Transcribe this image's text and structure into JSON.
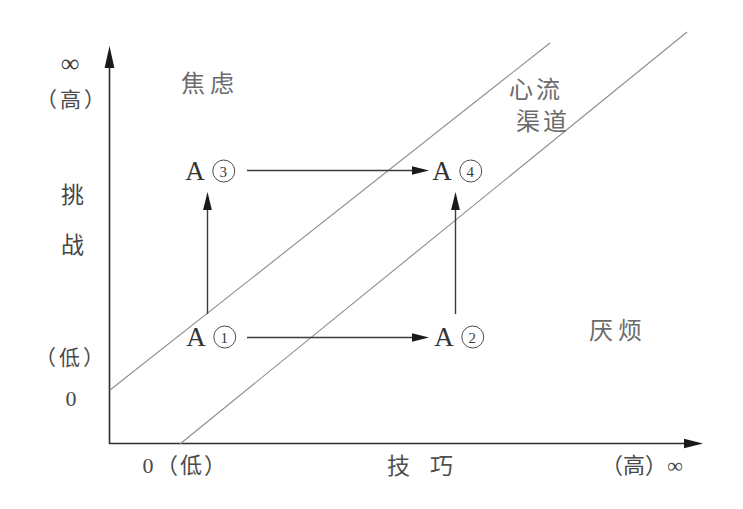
{
  "figure": {
    "type": "flow-channel-diagram",
    "colors": {
      "background": "#ffffff",
      "axis_ink": "#2e2e2e",
      "channel_line": "#8c8c8c",
      "arrow_ink": "#1a1a1a",
      "text_ink": "#4a4a4a"
    }
  },
  "y_axis": {
    "infinity_symbol": "∞",
    "high_label": "（高）",
    "title": "挑战",
    "low_label": "（低）",
    "origin_label": "0"
  },
  "x_axis": {
    "origin_label": "0（低）",
    "title": "技 巧",
    "high_label": "（高）∞"
  },
  "regions": {
    "anxiety": "焦虑",
    "flow_channel_line1": "心流",
    "flow_channel_line2": "渠道",
    "boredom": "厌烦"
  },
  "points": [
    {
      "letter": "A",
      "number": "1"
    },
    {
      "letter": "A",
      "number": "2"
    },
    {
      "letter": "A",
      "number": "3"
    },
    {
      "letter": "A",
      "number": "4"
    }
  ],
  "transitions": [
    "A1→A2",
    "A1→A3",
    "A2→A4",
    "A3→A4"
  ]
}
